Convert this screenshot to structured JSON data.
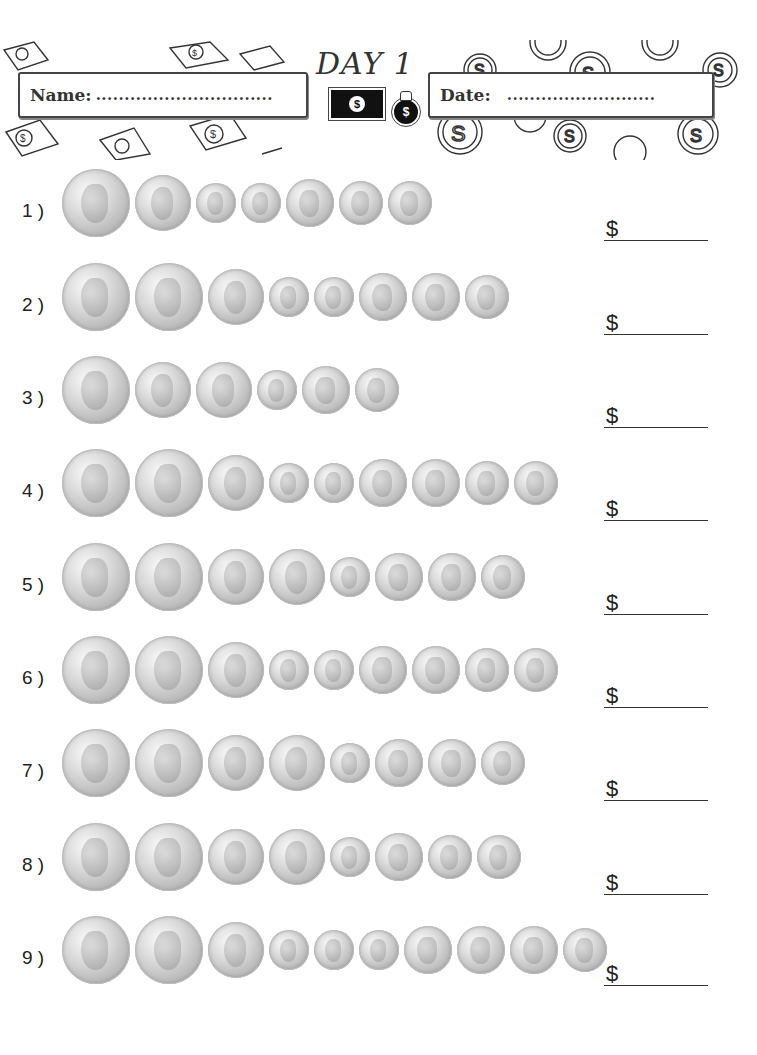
{
  "header": {
    "title": "DAY 1",
    "name_label": "Name:",
    "name_dots": "...............................",
    "date_label": "Date:",
    "date_dots": "..........................",
    "bill_symbol": "$",
    "bag_symbol": "$"
  },
  "answer_prefix": "$",
  "problems": [
    {
      "label": "1 )",
      "coins": [
        "half-dollar",
        "quarter",
        "dime",
        "dime",
        "nickel",
        "penny",
        "penny"
      ]
    },
    {
      "label": "2 )",
      "coins": [
        "half-dollar",
        "half-dollar",
        "quarter",
        "dime",
        "dime",
        "nickel",
        "nickel",
        "penny"
      ]
    },
    {
      "label": "3 )",
      "coins": [
        "half-dollar",
        "quarter",
        "quarter",
        "dime",
        "nickel",
        "penny"
      ]
    },
    {
      "label": "4 )",
      "coins": [
        "half-dollar",
        "half-dollar",
        "quarter",
        "dime",
        "dime",
        "nickel",
        "nickel",
        "penny",
        "penny"
      ]
    },
    {
      "label": "5 )",
      "coins": [
        "half-dollar",
        "half-dollar",
        "quarter",
        "quarter",
        "dime",
        "nickel",
        "nickel",
        "penny"
      ]
    },
    {
      "label": "6 )",
      "coins": [
        "half-dollar",
        "half-dollar",
        "quarter",
        "dime",
        "dime",
        "nickel",
        "nickel",
        "penny",
        "penny"
      ]
    },
    {
      "label": "7 )",
      "coins": [
        "half-dollar",
        "half-dollar",
        "quarter",
        "quarter",
        "dime",
        "nickel",
        "nickel",
        "penny"
      ]
    },
    {
      "label": "8 )",
      "coins": [
        "half-dollar",
        "half-dollar",
        "quarter",
        "quarter",
        "dime",
        "nickel",
        "penny",
        "penny"
      ]
    },
    {
      "label": "9 )",
      "coins": [
        "half-dollar",
        "half-dollar",
        "quarter",
        "dime",
        "dime",
        "dime",
        "nickel",
        "nickel",
        "nickel",
        "penny"
      ]
    }
  ]
}
